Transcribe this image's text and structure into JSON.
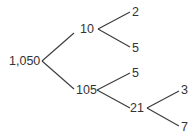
{
  "diagram": {
    "type": "factor-tree",
    "line_color": "#3a3a3a",
    "text_color": "#333333",
    "nodes": {
      "root": "1,050",
      "n10": "10",
      "n2": "2",
      "n5a": "5",
      "n105": "105",
      "n5b": "5",
      "n21": "21",
      "n3": "3",
      "n7": "7"
    },
    "edges": [
      [
        "1,050",
        "10"
      ],
      [
        "1,050",
        "105"
      ],
      [
        "10",
        "2"
      ],
      [
        "10",
        "5"
      ],
      [
        "105",
        "5"
      ],
      [
        "105",
        "21"
      ],
      [
        "21",
        "3"
      ],
      [
        "21",
        "7"
      ]
    ]
  }
}
